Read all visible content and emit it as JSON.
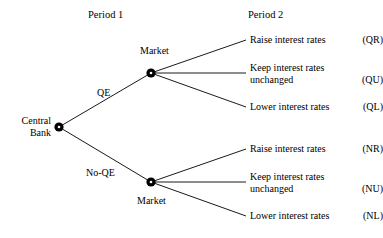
{
  "diagram": {
    "type": "decision-tree",
    "headers": {
      "period1": "Period 1",
      "period2": "Period 2"
    },
    "root": {
      "name": "central-bank",
      "label_line1": "Central",
      "label_line2": "Bank",
      "x": 59,
      "y": 127
    },
    "decision_nodes": [
      {
        "name": "market-qe",
        "label": "Market",
        "x": 151,
        "y": 73,
        "edge_label": "QE"
      },
      {
        "name": "market-no-qe",
        "label": "Market",
        "x": 151,
        "y": 182,
        "edge_label": "No-QE"
      }
    ],
    "edge_labels": {
      "upper": "QE",
      "lower": "No-QE"
    },
    "outcomes_qe": [
      {
        "text": "Raise interest rates",
        "code": "(QR)",
        "lines": 1
      },
      {
        "text_line1": "Keep interest rates",
        "text_line2": "unchanged",
        "code": "(QU)",
        "lines": 2
      },
      {
        "text": "Lower interest rates",
        "code": "(QL)",
        "lines": 1
      }
    ],
    "outcomes_no_qe": [
      {
        "text": "Raise interest rates",
        "code": "(NR)",
        "lines": 1
      },
      {
        "text_line1": "Keep interest rates",
        "text_line2": "unchanged",
        "code": "(NU)",
        "lines": 2
      },
      {
        "text": "Lower interest rates",
        "code": "(NL)",
        "lines": 1
      }
    ],
    "colors": {
      "line": "#1a1a1a",
      "node": "#000000",
      "background": "#ffffff",
      "text": "#000000"
    }
  }
}
